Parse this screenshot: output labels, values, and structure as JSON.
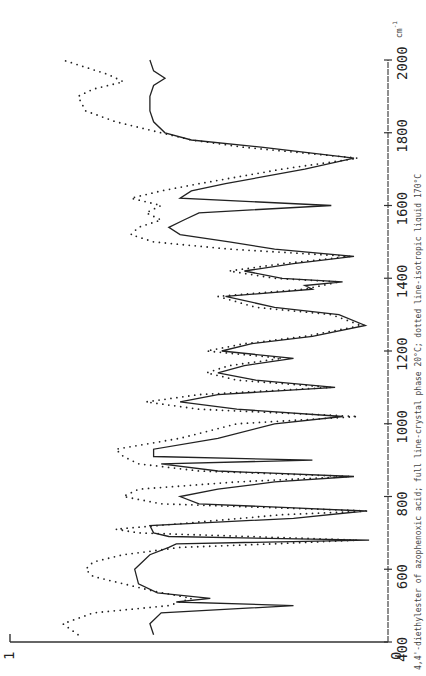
{
  "chart_data": {
    "type": "line",
    "title": "",
    "caption": "4,4'-diethylester of azophenoxic acid; full line-crystal phase 20°C; dotted line-isotropic liquid 170°C",
    "xlabel": "cm^-1",
    "ylabel": "",
    "orientation": "rotated 90° (wavenumber axis runs vertically on right, bottom=400 to top=2000)",
    "xlim": [
      400,
      2000
    ],
    "ylim": [
      0,
      1
    ],
    "x_ticks": [
      400,
      600,
      800,
      1000,
      1200,
      1400,
      1600,
      1800,
      2000
    ],
    "y_ticks": [
      0,
      1
    ],
    "unit": "cm⁻¹",
    "series": [
      {
        "name": "crystal phase 20°C",
        "style": "solid",
        "points": [
          [
            420,
            0.62
          ],
          [
            450,
            0.63
          ],
          [
            480,
            0.6
          ],
          [
            500,
            0.25
          ],
          [
            510,
            0.56
          ],
          [
            520,
            0.47
          ],
          [
            535,
            0.61
          ],
          [
            560,
            0.66
          ],
          [
            600,
            0.67
          ],
          [
            640,
            0.63
          ],
          [
            660,
            0.58
          ],
          [
            670,
            0.56
          ],
          [
            680,
            0.05
          ],
          [
            690,
            0.58
          ],
          [
            700,
            0.62
          ],
          [
            720,
            0.63
          ],
          [
            740,
            0.25
          ],
          [
            760,
            0.06
          ],
          [
            780,
            0.5
          ],
          [
            800,
            0.55
          ],
          [
            820,
            0.45
          ],
          [
            840,
            0.3
          ],
          [
            855,
            0.09
          ],
          [
            870,
            0.45
          ],
          [
            890,
            0.6
          ],
          [
            900,
            0.2
          ],
          [
            910,
            0.62
          ],
          [
            930,
            0.62
          ],
          [
            960,
            0.45
          ],
          [
            1000,
            0.3
          ],
          [
            1020,
            0.12
          ],
          [
            1040,
            0.4
          ],
          [
            1060,
            0.55
          ],
          [
            1080,
            0.45
          ],
          [
            1100,
            0.14
          ],
          [
            1120,
            0.35
          ],
          [
            1140,
            0.45
          ],
          [
            1160,
            0.38
          ],
          [
            1180,
            0.25
          ],
          [
            1200,
            0.44
          ],
          [
            1220,
            0.36
          ],
          [
            1240,
            0.2
          ],
          [
            1270,
            0.06
          ],
          [
            1300,
            0.13
          ],
          [
            1320,
            0.3
          ],
          [
            1350,
            0.43
          ],
          [
            1370,
            0.2
          ],
          [
            1380,
            0.22
          ],
          [
            1390,
            0.12
          ],
          [
            1400,
            0.28
          ],
          [
            1420,
            0.38
          ],
          [
            1440,
            0.25
          ],
          [
            1460,
            0.09
          ],
          [
            1480,
            0.3
          ],
          [
            1500,
            0.42
          ],
          [
            1520,
            0.55
          ],
          [
            1540,
            0.58
          ],
          [
            1560,
            0.54
          ],
          [
            1580,
            0.5
          ],
          [
            1600,
            0.15
          ],
          [
            1620,
            0.55
          ],
          [
            1640,
            0.52
          ],
          [
            1660,
            0.43
          ],
          [
            1700,
            0.22
          ],
          [
            1730,
            0.09
          ],
          [
            1760,
            0.33
          ],
          [
            1780,
            0.52
          ],
          [
            1800,
            0.59
          ],
          [
            1830,
            0.62
          ],
          [
            1860,
            0.63
          ],
          [
            1900,
            0.63
          ],
          [
            1930,
            0.62
          ],
          [
            1950,
            0.59
          ],
          [
            1970,
            0.62
          ],
          [
            2000,
            0.63
          ]
        ]
      },
      {
        "name": "isotropic liquid 170°C",
        "style": "dotted",
        "points": [
          [
            420,
            0.82
          ],
          [
            450,
            0.86
          ],
          [
            480,
            0.78
          ],
          [
            500,
            0.58
          ],
          [
            520,
            0.52
          ],
          [
            540,
            0.62
          ],
          [
            560,
            0.7
          ],
          [
            580,
            0.78
          ],
          [
            600,
            0.8
          ],
          [
            620,
            0.78
          ],
          [
            640,
            0.7
          ],
          [
            660,
            0.55
          ],
          [
            670,
            0.3
          ],
          [
            680,
            0.08
          ],
          [
            700,
            0.66
          ],
          [
            710,
            0.72
          ],
          [
            730,
            0.5
          ],
          [
            750,
            0.28
          ],
          [
            760,
            0.05
          ],
          [
            780,
            0.6
          ],
          [
            800,
            0.7
          ],
          [
            820,
            0.66
          ],
          [
            840,
            0.4
          ],
          [
            855,
            0.1
          ],
          [
            870,
            0.5
          ],
          [
            890,
            0.66
          ],
          [
            910,
            0.7
          ],
          [
            930,
            0.72
          ],
          [
            960,
            0.55
          ],
          [
            1000,
            0.4
          ],
          [
            1020,
            0.08
          ],
          [
            1040,
            0.5
          ],
          [
            1060,
            0.64
          ],
          [
            1080,
            0.5
          ],
          [
            1100,
            0.15
          ],
          [
            1120,
            0.4
          ],
          [
            1140,
            0.48
          ],
          [
            1160,
            0.42
          ],
          [
            1180,
            0.28
          ],
          [
            1200,
            0.48
          ],
          [
            1220,
            0.38
          ],
          [
            1240,
            0.22
          ],
          [
            1270,
            0.07
          ],
          [
            1300,
            0.15
          ],
          [
            1320,
            0.35
          ],
          [
            1350,
            0.45
          ],
          [
            1370,
            0.22
          ],
          [
            1390,
            0.13
          ],
          [
            1400,
            0.3
          ],
          [
            1420,
            0.42
          ],
          [
            1440,
            0.28
          ],
          [
            1460,
            0.1
          ],
          [
            1480,
            0.42
          ],
          [
            1500,
            0.62
          ],
          [
            1520,
            0.68
          ],
          [
            1540,
            0.66
          ],
          [
            1560,
            0.6
          ],
          [
            1580,
            0.64
          ],
          [
            1600,
            0.6
          ],
          [
            1620,
            0.68
          ],
          [
            1640,
            0.6
          ],
          [
            1660,
            0.5
          ],
          [
            1700,
            0.28
          ],
          [
            1730,
            0.08
          ],
          [
            1760,
            0.38
          ],
          [
            1780,
            0.52
          ],
          [
            1800,
            0.6
          ],
          [
            1830,
            0.72
          ],
          [
            1860,
            0.8
          ],
          [
            1900,
            0.82
          ],
          [
            1920,
            0.78
          ],
          [
            1940,
            0.7
          ],
          [
            1960,
            0.74
          ],
          [
            1980,
            0.8
          ],
          [
            2000,
            0.86
          ]
        ]
      }
    ],
    "grid": false,
    "legend": "none (described in caption)"
  },
  "axis": {
    "y_top_label": "1",
    "y_zero_label": "0",
    "x_tick_labels": [
      "400",
      "600",
      "800",
      "1000",
      "1200",
      "1400",
      "1600",
      "1800",
      "2000"
    ],
    "unit_label": "cm",
    "unit_exp": "-1"
  },
  "caption": "4,4'-diethylester of azophenoxic acid; full line-crystal phase 20°C; dotted line-isotropic liquid 170°C"
}
